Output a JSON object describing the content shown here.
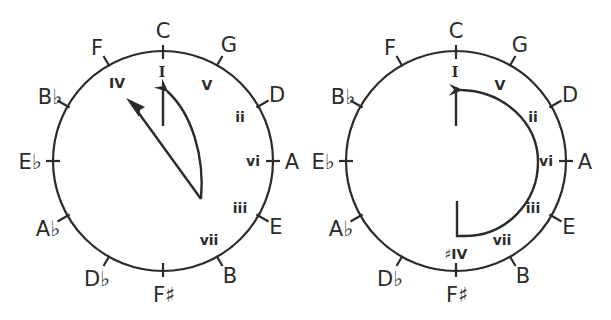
{
  "diagrams": [
    {
      "id": "left",
      "notes": [
        {
          "label": "C",
          "pos": 0
        },
        {
          "label": "G",
          "pos": 1
        },
        {
          "label": "D",
          "pos": 2
        },
        {
          "label": "A",
          "pos": 3
        },
        {
          "label": "E",
          "pos": 4
        },
        {
          "label": "B",
          "pos": 5
        },
        {
          "label": "F♯",
          "pos": 6
        },
        {
          "label": "D♭",
          "pos": 7
        },
        {
          "label": "A♭",
          "pos": 8
        },
        {
          "label": "E♭",
          "pos": 9
        },
        {
          "label": "B♭",
          "pos": 10
        },
        {
          "label": "F",
          "pos": 11
        }
      ],
      "numerals": {
        "I": "I",
        "V": "V",
        "ii": "ii",
        "vi": "vi",
        "iii": "iii",
        "vii": "vii",
        "IV": "IV"
      }
    },
    {
      "id": "right",
      "notes": [
        {
          "label": "C",
          "pos": 0
        },
        {
          "label": "G",
          "pos": 1
        },
        {
          "label": "D",
          "pos": 2
        },
        {
          "label": "A",
          "pos": 3
        },
        {
          "label": "E",
          "pos": 4
        },
        {
          "label": "B",
          "pos": 5
        },
        {
          "label": "F♯",
          "pos": 6
        },
        {
          "label": "D♭",
          "pos": 7
        },
        {
          "label": "A♭",
          "pos": 8
        },
        {
          "label": "E♭",
          "pos": 9
        },
        {
          "label": "B♭",
          "pos": 10
        },
        {
          "label": "F",
          "pos": 11
        }
      ],
      "numerals": {
        "I": "I",
        "V": "V",
        "ii": "ii",
        "vi": "vi",
        "iii": "iii",
        "vii": "vii",
        "sharpIV": "♯IV"
      }
    }
  ]
}
